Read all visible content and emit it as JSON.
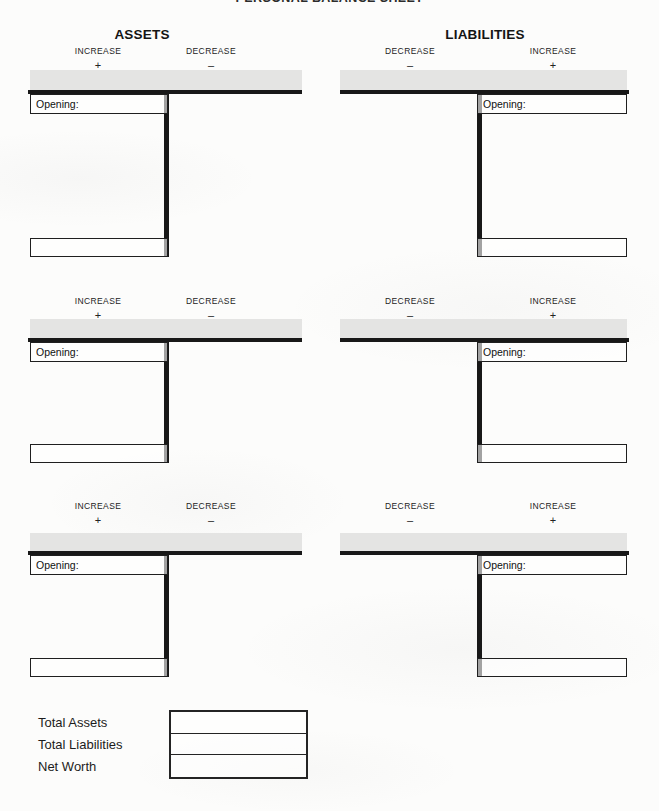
{
  "title": "PERSONAL BALANCE SHEET",
  "sections": {
    "assets": {
      "heading": "ASSETS",
      "left_label": "INCREASE",
      "left_sign": "+",
      "right_label": "DECREASE",
      "right_sign": "–"
    },
    "liabilities": {
      "heading": "LIABILITIES",
      "left_label": "DECREASE",
      "left_sign": "–",
      "right_label": "INCREASE",
      "right_sign": "+"
    }
  },
  "taccount": {
    "opening_label": "Opening:",
    "opening_value": "",
    "total_value": ""
  },
  "summary": {
    "labels": [
      "Total Assets",
      "Total Liabilities",
      "Net Worth"
    ],
    "values": [
      "",
      "",
      ""
    ]
  },
  "colors": {
    "header_bar": "#e4e4e3",
    "rule": "#181818",
    "paper": "#fcfcfb"
  }
}
